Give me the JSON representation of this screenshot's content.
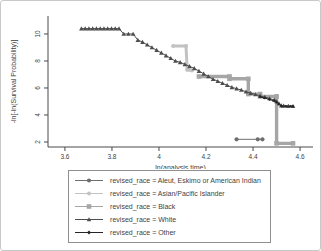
{
  "figure": {
    "background": "#ffffff",
    "frame_color": "#c9c9c9",
    "axis_color": "#4a4a4a",
    "text_color": "#3f3f3f",
    "legend_border_color": "#8f8f8f"
  },
  "chart_data": {
    "type": "line",
    "title": "",
    "xlabel": "ln(analysis time)",
    "ylabel": "-ln[-ln(Survival Probability)]",
    "xlim": [
      3.528,
      4.655
    ],
    "ylim": [
      1.63,
      11.33
    ],
    "x_ticks": [
      3.6,
      3.8,
      4,
      4.2,
      4.4,
      4.6
    ],
    "x_tick_labels": [
      "3.6",
      "3.8",
      "4",
      "4.2",
      "4.4",
      "4.6"
    ],
    "y_ticks": [
      2,
      4,
      6,
      8,
      10
    ],
    "y_tick_labels": [
      "2",
      "4",
      "6",
      "8",
      "10"
    ],
    "grid": false,
    "legend_position": "bottom",
    "series": [
      {
        "name": "revised_race = Aleut, Eskimo or American Indian",
        "color": "#6e6e6e",
        "marker": "circle",
        "line_width": 1,
        "marker_size": 2.1,
        "points": [
          [
            4.33,
            2.2
          ],
          [
            4.42,
            2.2
          ],
          [
            4.44,
            2.2
          ]
        ]
      },
      {
        "name": "revised_race = Asian/Pacific Islander",
        "color": "#c2c2c2",
        "marker": "circle",
        "line_width": 3,
        "marker_size": 2.0,
        "points": [
          [
            4.06,
            9.1
          ],
          [
            4.115,
            9.1
          ],
          [
            4.12,
            7.35
          ],
          [
            4.14,
            7.3
          ]
        ]
      },
      {
        "name": "revised_race = Black",
        "color": "#a6a6a6",
        "marker": "square",
        "line_width": 3.4,
        "marker_size": 2.3,
        "points": [
          [
            4.17,
            6.85
          ],
          [
            4.3,
            6.85
          ],
          [
            4.3,
            6.68
          ],
          [
            4.38,
            6.68
          ],
          [
            4.38,
            5.55
          ],
          [
            4.43,
            5.55
          ],
          [
            4.43,
            5.38
          ],
          [
            4.5,
            5.38
          ],
          [
            4.5,
            1.9
          ],
          [
            4.57,
            1.9
          ]
        ]
      },
      {
        "name": "revised_race = White",
        "color": "#4d4d4d",
        "marker": "triangle",
        "line_width": 1,
        "marker_size": 2.3,
        "points": [
          [
            3.67,
            10.4
          ],
          [
            3.686,
            10.4
          ],
          [
            3.702,
            10.4
          ],
          [
            3.718,
            10.4
          ],
          [
            3.734,
            10.4
          ],
          [
            3.75,
            10.4
          ],
          [
            3.766,
            10.4
          ],
          [
            3.782,
            10.4
          ],
          [
            3.798,
            10.4
          ],
          [
            3.814,
            10.4
          ],
          [
            3.83,
            10.4
          ],
          [
            3.85,
            10.0
          ],
          [
            3.87,
            10.0
          ],
          [
            3.89,
            10.0
          ],
          [
            3.91,
            9.55
          ],
          [
            3.93,
            9.4
          ],
          [
            3.95,
            9.2
          ],
          [
            3.97,
            9.0
          ],
          [
            3.99,
            8.8
          ],
          [
            4.01,
            8.6
          ],
          [
            4.03,
            8.4
          ],
          [
            4.05,
            8.2
          ],
          [
            4.07,
            8.0
          ],
          [
            4.09,
            7.9
          ],
          [
            4.11,
            7.75
          ],
          [
            4.13,
            7.6
          ],
          [
            4.15,
            7.45
          ],
          [
            4.17,
            7.25
          ],
          [
            4.19,
            7.05
          ],
          [
            4.21,
            6.85
          ],
          [
            4.23,
            6.65
          ],
          [
            4.25,
            6.5
          ],
          [
            4.27,
            6.35
          ],
          [
            4.29,
            6.2
          ],
          [
            4.31,
            6.05
          ],
          [
            4.33,
            5.95
          ],
          [
            4.35,
            5.85
          ],
          [
            4.37,
            5.72
          ],
          [
            4.39,
            5.62
          ],
          [
            4.41,
            5.52
          ],
          [
            4.43,
            5.42
          ],
          [
            4.45,
            5.32
          ],
          [
            4.47,
            5.22
          ],
          [
            4.49,
            5.12
          ],
          [
            4.5,
            5.0
          ],
          [
            4.51,
            4.85
          ],
          [
            4.52,
            4.7
          ],
          [
            4.53,
            4.68
          ],
          [
            4.55,
            4.66
          ],
          [
            4.57,
            4.65
          ]
        ]
      },
      {
        "name": "revised_race = Other",
        "color": "#262626",
        "marker": "diamond",
        "line_width": 1,
        "marker_size": 1.5,
        "points": [
          [
            4.43,
            5.35
          ],
          [
            4.45,
            5.25
          ],
          [
            4.47,
            5.15
          ],
          [
            4.49,
            5.05
          ],
          [
            4.5,
            4.95
          ],
          [
            4.51,
            4.8
          ],
          [
            4.52,
            4.66
          ],
          [
            4.54,
            4.65
          ],
          [
            4.56,
            4.65
          ],
          [
            4.57,
            4.65
          ]
        ]
      }
    ]
  }
}
